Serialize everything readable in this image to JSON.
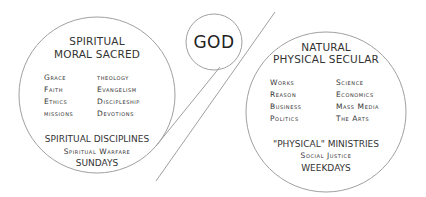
{
  "diagram": {
    "center": {
      "label": "GOD"
    },
    "left": {
      "heading_line1": "SPIRITUAL",
      "heading_line2": "MORAL SACRED",
      "col1": [
        "Grace",
        "Faith",
        "Ethics",
        "missions"
      ],
      "col2": [
        "theology",
        "Evangelism",
        "Discipleship",
        "Devotions"
      ],
      "footer1": "SPIRITUAL DISCIPLINES",
      "footer2": "Spiritual Warfare",
      "footer3": "SUNDAYS"
    },
    "right": {
      "heading_line1": "NATURAL",
      "heading_line2": "PHYSICAL SECULAR",
      "col1": [
        "Works",
        "Reason",
        "Business",
        "Politics"
      ],
      "col2": [
        "Science",
        "Economics",
        "Mass Media",
        "The Arts"
      ],
      "footer1": "\"PHYSICAL\" MINISTRIES",
      "footer2": "Social Justice",
      "footer3": "WEEKDAYS"
    },
    "colors": {
      "stroke": "#9a9a9a",
      "text": "#333333"
    }
  }
}
